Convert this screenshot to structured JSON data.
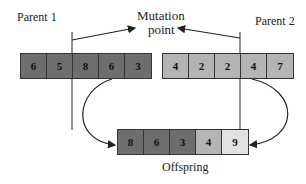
{
  "labels": {
    "parent1": "Parent 1",
    "parent2": "Parent 2",
    "mutation_line1": "Mutation",
    "mutation_line2": "point",
    "offspring": "Offspring"
  },
  "parent1": {
    "genes": [
      "6",
      "5",
      "8",
      "6",
      "3"
    ],
    "color": "#6e6e6e"
  },
  "parent2": {
    "genes": [
      "4",
      "2",
      "2",
      "4",
      "7"
    ],
    "color": "#b4b4b4"
  },
  "offspring": {
    "genes": [
      "8",
      "6",
      "3",
      "4",
      "9"
    ],
    "colors": [
      "#6e6e6e",
      "#6e6e6e",
      "#6e6e6e",
      "#b4b4b4",
      "#e2e2e2"
    ]
  }
}
